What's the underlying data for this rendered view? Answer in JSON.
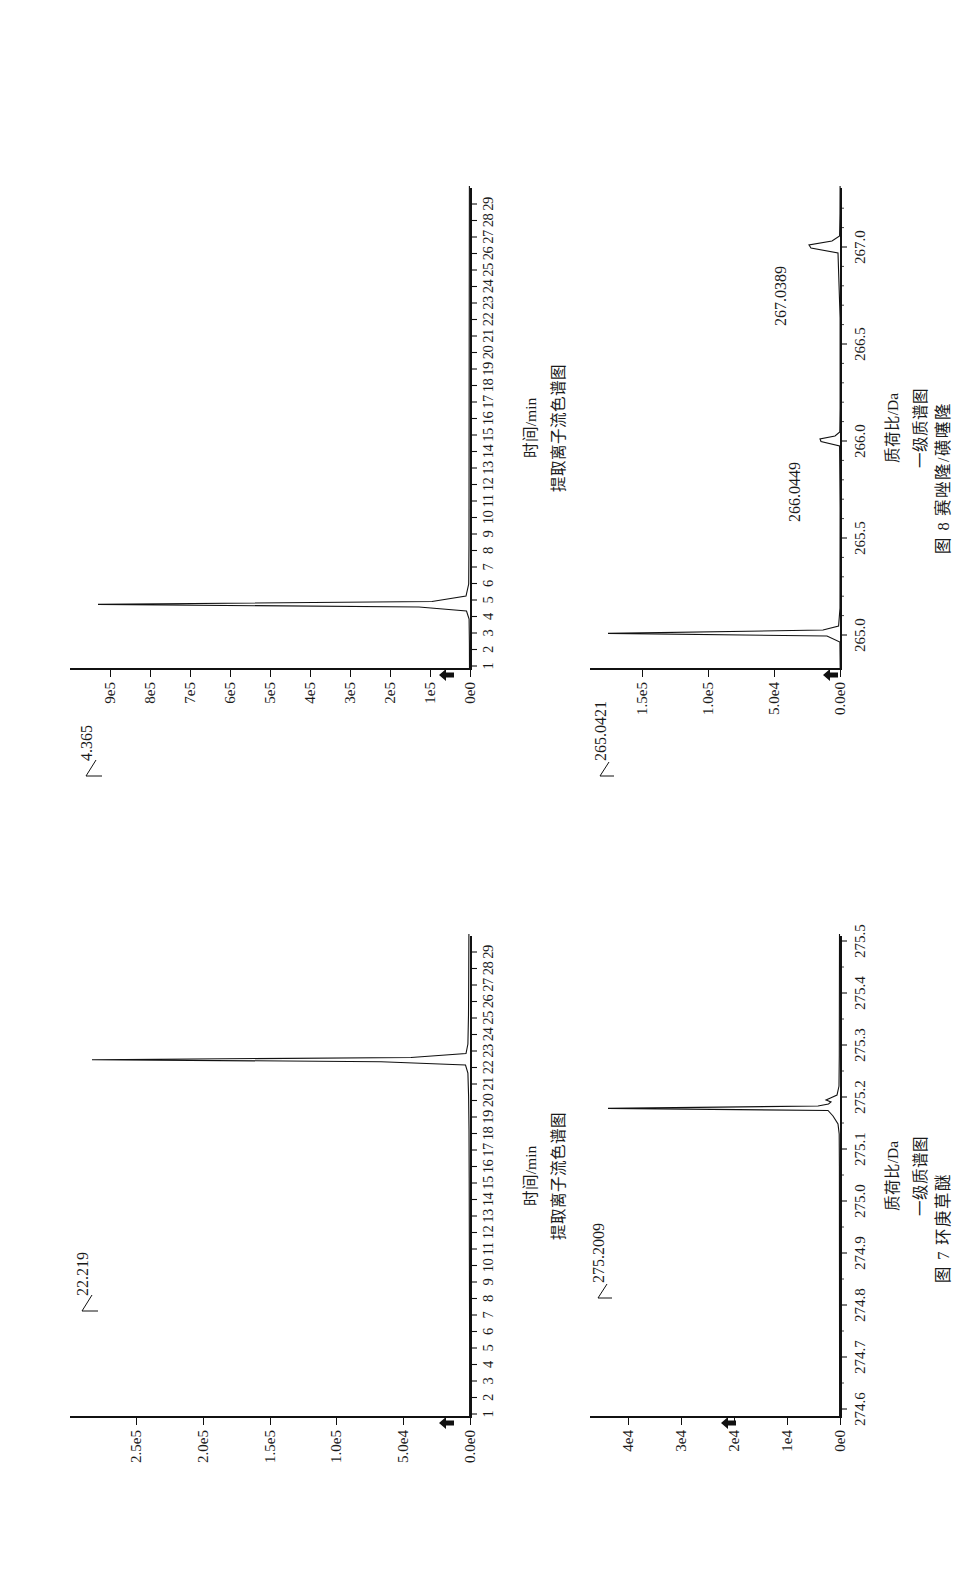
{
  "page": {
    "orientation": "landscape-content-rotated-90ccw",
    "background": "#ffffff",
    "ink": "#111111"
  },
  "figures": [
    {
      "id": "fig7",
      "caption": "图 7  环庚草醚",
      "caption_number": "图 7",
      "caption_name": "环庚草醚",
      "panels": [
        {
          "id": "fig7-eic",
          "kind": "chromatogram",
          "axis_title": "时间/min",
          "subtitle": "提取离子流色谱图",
          "peak_label": "22.219",
          "y_ticks": [
            "0.0e0",
            "5.0e4",
            "1.0e5",
            "1.5e5",
            "2.0e5",
            "2.5e5"
          ],
          "x_ticks": [
            "1",
            "2",
            "3",
            "4",
            "5",
            "6",
            "7",
            "8",
            "9",
            "10",
            "11",
            "12",
            "13",
            "14",
            "15",
            "16",
            "17",
            "18",
            "19",
            "20",
            "21",
            "22",
            "23",
            "24",
            "25",
            "26",
            "27",
            "28",
            "29"
          ]
        },
        {
          "id": "fig7-ms",
          "kind": "mass-spectrum",
          "axis_title": "质荷比/Da",
          "subtitle": "一级质谱图",
          "peak_label": "275.2009",
          "y_ticks": [
            "0e0",
            "1e4",
            "2e4",
            "3e4",
            "4e4"
          ],
          "x_ticks": [
            "274.6",
            "274.7",
            "274.8",
            "274.9",
            "275.0",
            "275.1",
            "275.2",
            "275.3",
            "275.4",
            "275.5"
          ]
        }
      ]
    },
    {
      "id": "fig8",
      "caption": "图 8  赛唑隆/磺噻隆",
      "caption_number": "图 8",
      "caption_name": "赛唑隆/磺噻隆",
      "panels": [
        {
          "id": "fig8-eic",
          "kind": "chromatogram",
          "axis_title": "时间/min",
          "subtitle": "提取离子流色谱图",
          "peak_label": "4.365",
          "y_ticks": [
            "0e0",
            "1e5",
            "2e5",
            "3e5",
            "4e5",
            "5e5",
            "6e5",
            "7e5",
            "8e5",
            "9e5"
          ],
          "x_ticks": [
            "1",
            "2",
            "3",
            "4",
            "5",
            "6",
            "7",
            "8",
            "9",
            "10",
            "11",
            "12",
            "13",
            "14",
            "15",
            "16",
            "17",
            "18",
            "19",
            "20",
            "21",
            "22",
            "23",
            "24",
            "25",
            "26",
            "27",
            "28",
            "29"
          ]
        },
        {
          "id": "fig8-ms",
          "kind": "mass-spectrum",
          "axis_title": "质荷比/Da",
          "subtitle": "一级质谱图",
          "peak_labels": [
            "265.0421",
            "266.0449",
            "267.0389"
          ],
          "peak_label_main": "265.0421",
          "peak_label_iso1": "266.0449",
          "peak_label_iso2": "267.0389",
          "y_ticks": [
            "0.0e0",
            "5.0e4",
            "1.0e5",
            "1.5e5"
          ],
          "x_ticks": [
            "265.0",
            "265.5",
            "266.0",
            "266.5",
            "267.0"
          ]
        }
      ]
    }
  ],
  "chart_data": [
    {
      "id": "fig7-eic",
      "type": "line",
      "title": "提取离子流色谱图",
      "xlabel": "时间/min",
      "ylabel": "",
      "xlim": [
        0.5,
        29.5
      ],
      "ylim": [
        0,
        270000
      ],
      "xticks": [
        1,
        2,
        3,
        4,
        5,
        6,
        7,
        8,
        9,
        10,
        11,
        12,
        13,
        14,
        15,
        16,
        17,
        18,
        19,
        20,
        21,
        22,
        23,
        24,
        25,
        26,
        27,
        28,
        29
      ],
      "yticks": [
        0,
        50000,
        100000,
        150000,
        200000,
        250000
      ],
      "ytick_labels": [
        "0.0e0",
        "5.0e4",
        "1.0e5",
        "1.5e5",
        "2.0e5",
        "2.5e5"
      ],
      "grid": false,
      "annotations": [
        {
          "text": "22.219",
          "x": 22.219,
          "y": 255000
        }
      ],
      "series": [
        {
          "name": "EIC",
          "points": [
            [
              0.5,
              300
            ],
            [
              5,
              300
            ],
            [
              10,
              400
            ],
            [
              15,
              500
            ],
            [
              18,
              600
            ],
            [
              20,
              900
            ],
            [
              21.4,
              1400
            ],
            [
              21.9,
              3000
            ],
            [
              22.1,
              60000
            ],
            [
              22.219,
              255000
            ],
            [
              22.35,
              40000
            ],
            [
              22.6,
              3000
            ],
            [
              23.2,
              900
            ],
            [
              25,
              500
            ],
            [
              27,
              400
            ],
            [
              29.5,
              350
            ]
          ]
        }
      ]
    },
    {
      "id": "fig7-ms",
      "type": "line",
      "title": "一级质谱图",
      "xlabel": "质荷比/Da",
      "ylabel": "",
      "xlim": [
        274.55,
        275.56
      ],
      "ylim": [
        0,
        44000
      ],
      "xticks": [
        274.6,
        274.7,
        274.8,
        274.9,
        275.0,
        275.1,
        275.2,
        275.3,
        275.4,
        275.5
      ],
      "yticks": [
        0,
        10000,
        20000,
        30000,
        40000
      ],
      "ytick_labels": [
        "0e0",
        "1e4",
        "2e4",
        "3e4",
        "4e4"
      ],
      "grid": false,
      "annotations": [
        {
          "text": "275.2009",
          "x": 275.2009,
          "y": 41000
        }
      ],
      "series": [
        {
          "name": "MS1",
          "points": [
            [
              274.55,
              60
            ],
            [
              275.1,
              80
            ],
            [
              275.16,
              200
            ],
            [
              275.185,
              1200
            ],
            [
              275.2009,
              41000
            ],
            [
              275.215,
              2500
            ],
            [
              275.225,
              1600
            ],
            [
              275.25,
              300
            ],
            [
              275.3,
              90
            ],
            [
              275.56,
              60
            ]
          ]
        }
      ]
    },
    {
      "id": "fig8-eic",
      "type": "line",
      "title": "提取离子流色谱图",
      "xlabel": "时间/min",
      "ylabel": "",
      "xlim": [
        0.5,
        29.5
      ],
      "ylim": [
        0,
        950000
      ],
      "xticks": [
        1,
        2,
        3,
        4,
        5,
        6,
        7,
        8,
        9,
        10,
        11,
        12,
        13,
        14,
        15,
        16,
        17,
        18,
        19,
        20,
        21,
        22,
        23,
        24,
        25,
        26,
        27,
        28,
        29
      ],
      "yticks": [
        0,
        100000,
        200000,
        300000,
        400000,
        500000,
        600000,
        700000,
        800000,
        900000
      ],
      "ytick_labels": [
        "0e0",
        "1e5",
        "2e5",
        "3e5",
        "4e5",
        "5e5",
        "6e5",
        "7e5",
        "8e5",
        "9e5"
      ],
      "grid": false,
      "annotations": [
        {
          "text": "4.365",
          "x": 4.365,
          "y": 880000
        }
      ],
      "series": [
        {
          "name": "EIC",
          "points": [
            [
              0.5,
              1000
            ],
            [
              2,
              1200
            ],
            [
              3.5,
              2000
            ],
            [
              4.0,
              6000
            ],
            [
              4.25,
              120000
            ],
            [
              4.365,
              880000
            ],
            [
              4.55,
              90000
            ],
            [
              4.9,
              9000
            ],
            [
              5.6,
              3000
            ],
            [
              8,
              2000
            ],
            [
              14,
              1800
            ],
            [
              20,
              1500
            ],
            [
              25,
              1400
            ],
            [
              29.5,
              1200
            ]
          ]
        }
      ]
    },
    {
      "id": "fig8-ms",
      "type": "line",
      "title": "一级质谱图",
      "xlabel": "质荷比/Da",
      "ylabel": "",
      "xlim": [
        264.82,
        267.3
      ],
      "ylim": [
        0,
        175000
      ],
      "xticks": [
        265.0,
        265.5,
        266.0,
        266.5,
        267.0
      ],
      "yticks": [
        0,
        50000,
        100000,
        150000
      ],
      "ytick_labels": [
        "0.0e0",
        "5.0e4",
        "1.0e5",
        "1.5e5"
      ],
      "grid": false,
      "annotations": [
        {
          "text": "265.0421",
          "x": 265.0421,
          "y": 162000
        },
        {
          "text": "266.0449",
          "x": 266.0449,
          "y": 22000
        },
        {
          "text": "267.0389",
          "x": 267.0389,
          "y": 30000
        }
      ],
      "series": [
        {
          "name": "MS1",
          "points": [
            [
              264.82,
              200
            ],
            [
              264.97,
              400
            ],
            [
              265.012,
              9000
            ],
            [
              265.0421,
              162000
            ],
            [
              265.072,
              12000
            ],
            [
              265.12,
              900
            ],
            [
              265.4,
              300
            ],
            [
              265.9,
              300
            ],
            [
              265.995,
              1800
            ],
            [
              266.0449,
              14000
            ],
            [
              266.095,
              2000
            ],
            [
              266.3,
              300
            ],
            [
              266.9,
              300
            ],
            [
              266.99,
              3500
            ],
            [
              267.0389,
              21000
            ],
            [
              267.09,
              3000
            ],
            [
              267.2,
              400
            ],
            [
              267.3,
              300
            ]
          ]
        }
      ]
    }
  ]
}
